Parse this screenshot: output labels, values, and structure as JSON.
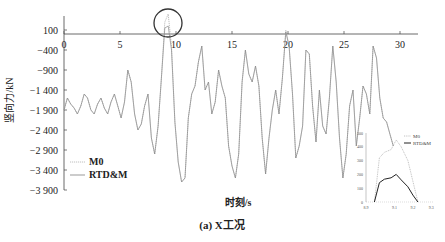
{
  "chart_data": {
    "type": "line",
    "title": "",
    "caption": "(a) X工况",
    "xlabel": "时刻/s",
    "ylabel": "竖向力/kN",
    "xlim": [
      0,
      32
    ],
    "ylim": [
      -3900,
      200
    ],
    "x_ticks": [
      "0",
      "5",
      "10",
      "15",
      "20",
      "25",
      "30"
    ],
    "y_ticks": [
      "100",
      "-400",
      "-900",
      "-1 400",
      "-1 900",
      "-2 400",
      "-2 900",
      "-3 400",
      "-3 900"
    ],
    "grid": false,
    "legend": {
      "position": "lower-left",
      "entries": [
        "M0",
        "RTD&M"
      ]
    },
    "series": [
      {
        "name": "M0",
        "style": "dotted",
        "x": [
          0,
          0.3,
          0.6,
          0.9,
          1.2,
          1.5,
          1.8,
          2.1,
          2.4,
          2.7,
          3.0,
          3.3,
          3.6,
          3.9,
          4.2,
          4.5,
          4.8,
          5.1,
          5.4,
          5.7,
          6.0,
          6.3,
          6.6,
          6.9,
          7.2,
          7.5,
          7.8,
          8.1,
          8.4,
          8.7,
          9.0,
          9.3,
          9.6,
          9.9,
          10.2,
          10.5,
          10.8,
          11.1,
          11.4,
          11.7,
          12.0,
          12.3,
          12.6,
          12.9,
          13.2,
          13.5,
          13.8,
          14.1,
          14.4,
          14.7,
          15.0,
          15.3,
          15.6,
          15.9,
          16.2,
          16.5,
          16.8,
          17.1,
          17.4,
          17.7,
          18.0,
          18.3,
          18.6,
          18.9,
          19.2,
          19.5,
          19.8,
          20.1,
          20.4,
          20.7,
          21.0,
          21.3,
          21.6,
          21.9,
          22.2,
          22.5,
          22.8,
          23.1,
          23.4,
          23.7,
          24.0,
          24.3,
          24.6,
          24.9,
          25.2,
          25.5,
          25.8,
          26.1,
          26.4,
          26.7,
          27.0,
          27.3,
          27.6,
          27.9,
          28.2,
          28.5,
          28.8,
          29.1,
          29.4
        ],
        "values": [
          -1900,
          -1600,
          -1750,
          -1850,
          -2000,
          -1800,
          -1500,
          -1600,
          -1900,
          -2000,
          -1750,
          -1600,
          -1850,
          -2000,
          -1700,
          -1500,
          -1800,
          -2100,
          -1700,
          -900,
          -1200,
          -2000,
          -2400,
          -2250,
          -1800,
          -1500,
          -2600,
          -3000,
          -2300,
          -1100,
          300,
          500,
          -300,
          -2200,
          -3200,
          -3700,
          -3600,
          -2100,
          -1500,
          -1300,
          -700,
          -300,
          -1400,
          -1200,
          -2000,
          -1700,
          -900,
          -1300,
          -1600,
          -2800,
          -3300,
          -3600,
          -3000,
          -1200,
          -400,
          -1000,
          -1200,
          -800,
          -1300,
          -2600,
          -3500,
          -2600,
          -1900,
          -1400,
          -2000,
          -1100,
          100,
          -300,
          -1500,
          -3100,
          -2800,
          -2300,
          -400,
          -500,
          -1800,
          -2700,
          -1400,
          -2300,
          -2500,
          -1600,
          -300,
          -1200,
          -2600,
          -3600,
          -3000,
          -1800,
          -1400,
          -2800,
          -2100,
          -1300,
          -1500,
          -2000,
          -300,
          -600,
          -1600,
          -2100,
          -2200,
          -2500,
          -2800
        ]
      },
      {
        "name": "RTD&M",
        "style": "solid",
        "x": [
          0,
          0.3,
          0.6,
          0.9,
          1.2,
          1.5,
          1.8,
          2.1,
          2.4,
          2.7,
          3.0,
          3.3,
          3.6,
          3.9,
          4.2,
          4.5,
          4.8,
          5.1,
          5.4,
          5.7,
          6.0,
          6.3,
          6.6,
          6.9,
          7.2,
          7.5,
          7.8,
          8.1,
          8.4,
          8.7,
          9.0,
          9.3,
          9.6,
          9.9,
          10.2,
          10.5,
          10.8,
          11.1,
          11.4,
          11.7,
          12.0,
          12.3,
          12.6,
          12.9,
          13.2,
          13.5,
          13.8,
          14.1,
          14.4,
          14.7,
          15.0,
          15.3,
          15.6,
          15.9,
          16.2,
          16.5,
          16.8,
          17.1,
          17.4,
          17.7,
          18.0,
          18.3,
          18.6,
          18.9,
          19.2,
          19.5,
          19.8,
          20.1,
          20.4,
          20.7,
          21.0,
          21.3,
          21.6,
          21.9,
          22.2,
          22.5,
          22.8,
          23.1,
          23.4,
          23.7,
          24.0,
          24.3,
          24.6,
          24.9,
          25.2,
          25.5,
          25.8,
          26.1,
          26.4,
          26.7,
          27.0,
          27.3,
          27.6,
          27.9,
          28.2,
          28.5,
          28.8,
          29.1,
          29.4
        ],
        "values": [
          -1900,
          -1600,
          -1750,
          -1850,
          -2000,
          -1800,
          -1500,
          -1600,
          -1900,
          -2000,
          -1750,
          -1600,
          -1850,
          -2000,
          -1700,
          -1500,
          -1800,
          -2100,
          -1700,
          -900,
          -1200,
          -2000,
          -2400,
          -2250,
          -1800,
          -1500,
          -2600,
          -3000,
          -2300,
          -1100,
          150,
          200,
          -400,
          -2200,
          -3200,
          -3700,
          -3600,
          -2100,
          -1500,
          -1300,
          -700,
          -300,
          -1400,
          -1200,
          -2000,
          -1700,
          -900,
          -1300,
          -1600,
          -2800,
          -3300,
          -3600,
          -3000,
          -1200,
          -400,
          -1000,
          -1200,
          -800,
          -1300,
          -2600,
          -3500,
          -2600,
          -1900,
          -1400,
          -2000,
          -1100,
          50,
          -300,
          -1500,
          -3100,
          -2800,
          -2300,
          -400,
          -500,
          -1800,
          -2700,
          -1400,
          -2300,
          -2500,
          -1600,
          -300,
          -1200,
          -2600,
          -3600,
          -3000,
          -1800,
          -1400,
          -2800,
          -2100,
          -1300,
          -1500,
          -2000,
          -300,
          -600,
          -1600,
          -2100,
          -2200,
          -2500,
          -2800
        ]
      }
    ],
    "annotations": [
      {
        "type": "circle",
        "label": "peak highlight",
        "x": 9.3,
        "y": 300
      }
    ],
    "inset": {
      "type": "line",
      "x_ticks": [
        "8.9",
        "9.1",
        "9.2",
        "9.3"
      ],
      "y_ticks": [
        "0",
        "100",
        "200",
        "300",
        "400",
        "500"
      ],
      "legend": [
        "M0",
        "RTD&M"
      ],
      "series": [
        {
          "name": "M0",
          "style": "dotted",
          "x": [
            9.0,
            9.03,
            9.06,
            9.1,
            9.13,
            9.16,
            9.2,
            9.23,
            9.26
          ],
          "values": [
            0,
            320,
            360,
            380,
            450,
            400,
            300,
            150,
            0
          ]
        },
        {
          "name": "RTD&M",
          "style": "solid",
          "x": [
            9.0,
            9.03,
            9.06,
            9.1,
            9.13,
            9.16,
            9.2,
            9.23,
            9.26
          ],
          "values": [
            0,
            140,
            165,
            175,
            200,
            160,
            110,
            50,
            0
          ]
        }
      ]
    }
  }
}
